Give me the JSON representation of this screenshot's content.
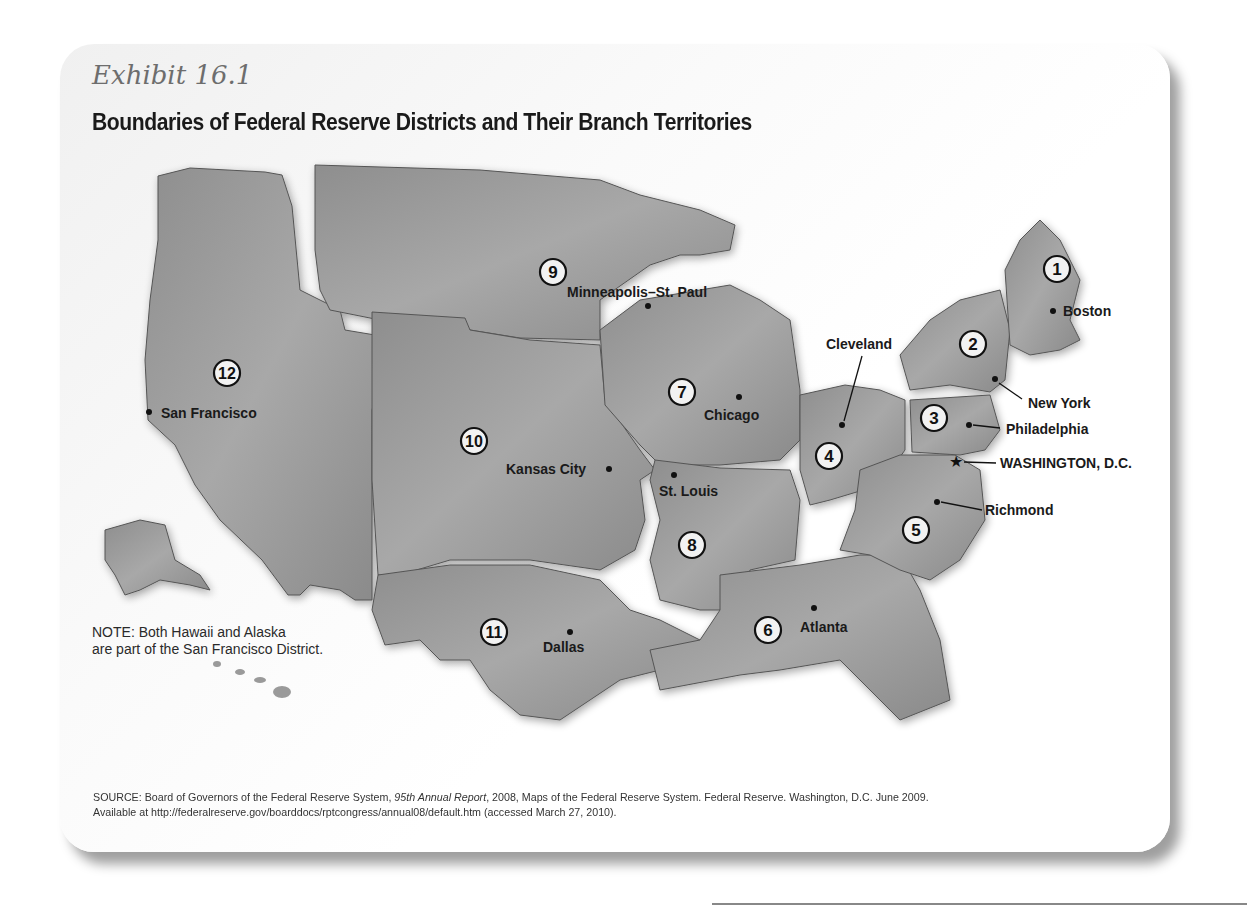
{
  "header": {
    "exhibit": "Exhibit 16.1",
    "title": "Boundaries of Federal Reserve Districts and Their Branch Territories"
  },
  "map": {
    "districts": [
      {
        "number": "1",
        "city": "Boston"
      },
      {
        "number": "2",
        "city": "New York"
      },
      {
        "number": "3",
        "city": "Philadelphia"
      },
      {
        "number": "4",
        "city": "Cleveland"
      },
      {
        "number": "5",
        "city": "Richmond"
      },
      {
        "number": "6",
        "city": "Atlanta"
      },
      {
        "number": "7",
        "city": "Chicago"
      },
      {
        "number": "8",
        "city": "St. Louis"
      },
      {
        "number": "9",
        "city": "Minneapolis–St. Paul"
      },
      {
        "number": "10",
        "city": "Kansas City"
      },
      {
        "number": "11",
        "city": "Dallas"
      },
      {
        "number": "12",
        "city": "San Francisco"
      }
    ],
    "capital": "WASHINGTON, D.C.",
    "colors": {
      "land": "#9a9a9a",
      "gap": "#ffffff",
      "border": "#3a3a3a"
    }
  },
  "note": {
    "line1": "NOTE: Both Hawaii and Alaska",
    "line2": "are part of the San Francisco District."
  },
  "source": {
    "prefix": "SOURCE: Board of Governors of the Federal Reserve System, ",
    "report": "95th Annual Report",
    "suffix": ", 2008, Maps of the Federal Reserve System. Federal Reserve. Washington, D.C. June 2009.",
    "line2": "Available at http://federalreserve.gov/boarddocs/rptcongress/annual08/default.htm (accessed March 27, 2010)."
  }
}
